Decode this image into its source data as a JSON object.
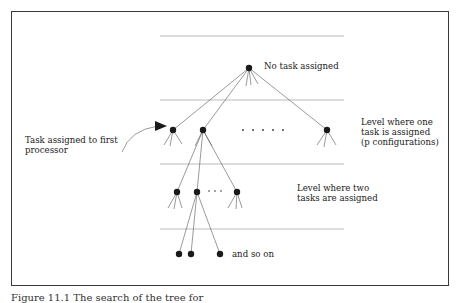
{
  "diagram": {
    "type": "search-tree",
    "labels": {
      "root": "No task assigned",
      "first_task": "Task assigned to first\nprocessor",
      "level1": "Level where one\ntask is assigned\n(p configurations)",
      "level2": "Level where two\ntasks are assigned",
      "level3": "and so on"
    },
    "caption": "Figure 11.1  The search of the tree for",
    "colors": {
      "node": "#1a1a1a",
      "edge": "#555555",
      "level_line": "#aaaaaa",
      "border": "#3a3a3a"
    },
    "levels": [
      {
        "name": "root",
        "nodes": 1
      },
      {
        "name": "one task assigned",
        "nodes": "p",
        "ellipsis": ". . . . ."
      },
      {
        "name": "two tasks assigned",
        "ellipsis": ". . ."
      },
      {
        "name": "and so on"
      }
    ]
  }
}
